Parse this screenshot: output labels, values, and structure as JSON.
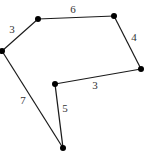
{
  "diagram": {
    "type": "polygon-with-edge-lengths",
    "vertices": [
      "A",
      "B",
      "C",
      "D",
      "E",
      "F"
    ],
    "edges": [
      {
        "from": "A",
        "to": "B",
        "label": "3"
      },
      {
        "from": "B",
        "to": "C",
        "label": "6"
      },
      {
        "from": "C",
        "to": "D",
        "label": "4"
      },
      {
        "from": "D",
        "to": "E",
        "label": "3"
      },
      {
        "from": "E",
        "to": "F",
        "label": "5"
      },
      {
        "from": "F",
        "to": "A",
        "label": "7"
      }
    ]
  }
}
